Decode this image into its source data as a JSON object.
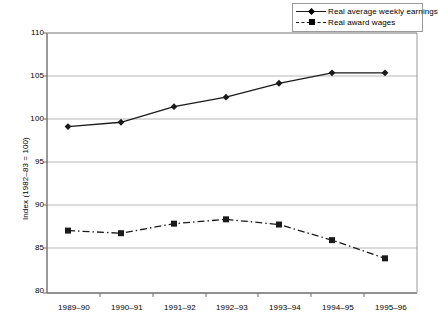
{
  "chart_data": {
    "type": "line",
    "title": "",
    "xlabel": "",
    "ylabel": "Index (1982–83 = 100)",
    "categories": [
      "1989–90",
      "1990–91",
      "1991–92",
      "1992–93",
      "1993–94",
      "1994–95",
      "1995–96"
    ],
    "ylim": [
      80,
      110
    ],
    "yticks": [
      80,
      85,
      90,
      95,
      100,
      105,
      110
    ],
    "ytick_labels": [
      "80",
      "85",
      "90",
      "95",
      "100",
      "105",
      "110"
    ],
    "grid": "horizontal",
    "legend_position": "top-right",
    "series": [
      {
        "name": "Real average weekly earnings",
        "marker": "diamond",
        "line_style": "solid",
        "color": "#1a1a1a",
        "values": [
          99.2,
          99.7,
          101.5,
          102.6,
          104.2,
          105.4,
          105.4
        ]
      },
      {
        "name": "Real award wages",
        "marker": "square",
        "line_style": "dash-dot",
        "color": "#1a1a1a",
        "values": [
          87.2,
          86.9,
          88.0,
          88.5,
          87.9,
          86.1,
          84.0
        ]
      }
    ]
  },
  "legend": {
    "items": [
      {
        "label": "Real average weekly earnings"
      },
      {
        "label": "Real award wages"
      }
    ]
  },
  "axes": {
    "y_title": "Index (1982–83 = 100)",
    "y_tick_labels": [
      "110",
      "105",
      "100",
      "95",
      "90",
      "85",
      "80"
    ],
    "x_tick_labels": [
      "1989–90",
      "1990–91",
      "1991–92",
      "1992–93",
      "1993–94",
      "1994–95",
      "1995–96"
    ]
  },
  "colors": {
    "line": "#1a1a1a",
    "grid": "#b8b8b8",
    "axis": "#6e6e6e",
    "background": "#ffffff"
  }
}
